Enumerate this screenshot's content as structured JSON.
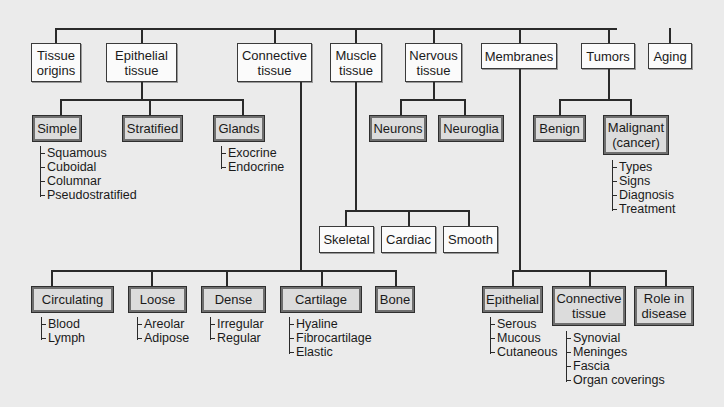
{
  "diagram": {
    "root": {
      "children": [
        {
          "id": "tissue-origins",
          "label": "Tissue\norigins"
        },
        {
          "id": "epithelial-tissue",
          "label": "Epithelial\ntissue",
          "children": [
            {
              "id": "simple",
              "label": "Simple",
              "items": [
                "Squamous",
                "Cuboidal",
                "Columnar",
                "Pseudostratified"
              ]
            },
            {
              "id": "stratified",
              "label": "Stratified"
            },
            {
              "id": "glands",
              "label": "Glands",
              "items": [
                "Exocrine",
                "Endocrine"
              ]
            }
          ]
        },
        {
          "id": "connective-tissue",
          "label": "Connective\ntissue",
          "children": [
            {
              "id": "circulating",
              "label": "Circulating",
              "items": [
                "Blood",
                "Lymph"
              ]
            },
            {
              "id": "loose",
              "label": "Loose",
              "items": [
                "Areolar",
                "Adipose"
              ]
            },
            {
              "id": "dense",
              "label": "Dense",
              "items": [
                "Irregular",
                "Regular"
              ]
            },
            {
              "id": "cartilage",
              "label": "Cartilage",
              "items": [
                "Hyaline",
                "Fibrocartilage",
                "Elastic"
              ]
            },
            {
              "id": "bone",
              "label": "Bone"
            }
          ]
        },
        {
          "id": "muscle-tissue",
          "label": "Muscle\ntissue",
          "children": [
            {
              "id": "skeletal",
              "label": "Skeletal"
            },
            {
              "id": "cardiac",
              "label": "Cardiac"
            },
            {
              "id": "smooth",
              "label": "Smooth"
            }
          ]
        },
        {
          "id": "nervous-tissue",
          "label": "Nervous\ntissue",
          "children": [
            {
              "id": "neurons",
              "label": "Neurons"
            },
            {
              "id": "neuroglia",
              "label": "Neuroglia"
            }
          ]
        },
        {
          "id": "membranes",
          "label": "Membranes",
          "children": [
            {
              "id": "epithelial-membranes",
              "label": "Epithelial",
              "items": [
                "Serous",
                "Mucous",
                "Cutaneous"
              ]
            },
            {
              "id": "connective-membranes",
              "label": "Connective\ntissue",
              "items": [
                "Synovial",
                "Meninges",
                "Fascia",
                "Organ coverings"
              ]
            },
            {
              "id": "role-in-disease",
              "label": "Role in\ndisease"
            }
          ]
        },
        {
          "id": "tumors",
          "label": "Tumors",
          "children": [
            {
              "id": "benign",
              "label": "Benign"
            },
            {
              "id": "malignant",
              "label": "Malignant\n(cancer)",
              "items": [
                "Types",
                "Signs",
                "Diagnosis",
                "Treatment"
              ]
            }
          ]
        },
        {
          "id": "aging",
          "label": "Aging"
        }
      ]
    }
  },
  "labels": {
    "tissue_origins_1": "Tissue",
    "tissue_origins_2": "origins",
    "epithelial_1": "Epithelial",
    "epithelial_2": "tissue",
    "connective_1": "Connective",
    "connective_2": "tissue",
    "muscle_1": "Muscle",
    "muscle_2": "tissue",
    "nervous_1": "Nervous",
    "nervous_2": "tissue",
    "membranes": "Membranes",
    "tumors": "Tumors",
    "aging": "Aging",
    "simple": "Simple",
    "stratified": "Stratified",
    "glands": "Glands",
    "neurons": "Neurons",
    "neuroglia": "Neuroglia",
    "benign": "Benign",
    "malignant_1": "Malignant",
    "malignant_2": "(cancer)",
    "skeletal": "Skeletal",
    "cardiac": "Cardiac",
    "smooth": "Smooth",
    "circulating": "Circulating",
    "loose": "Loose",
    "dense": "Dense",
    "cartilage": "Cartilage",
    "bone": "Bone",
    "epi_mem": "Epithelial",
    "conn_mem_1": "Connective",
    "conn_mem_2": "tissue",
    "role_1": "Role in",
    "role_2": "disease"
  },
  "lists": {
    "simple": [
      "Squamous",
      "Cuboidal",
      "Columnar",
      "Pseudostratified"
    ],
    "glands": [
      "Exocrine",
      "Endocrine"
    ],
    "malignant": [
      "Types",
      "Signs",
      "Diagnosis",
      "Treatment"
    ],
    "circulating": [
      "Blood",
      "Lymph"
    ],
    "loose": [
      "Areolar",
      "Adipose"
    ],
    "dense": [
      "Irregular",
      "Regular"
    ],
    "cartilage": [
      "Hyaline",
      "Fibrocartilage",
      "Elastic"
    ],
    "epi_mem": [
      "Serous",
      "Mucous",
      "Cutaneous"
    ],
    "conn_mem": [
      "Synovial",
      "Meninges",
      "Fascia",
      "Organ coverings"
    ]
  },
  "colors": {
    "background": "#ebebeb",
    "white_box": "#fbfbfb",
    "shaded_box": "#dcdcdc",
    "line": "#2a2a2a"
  }
}
